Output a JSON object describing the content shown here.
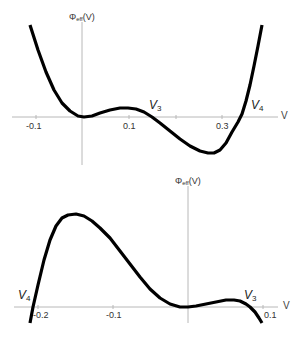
{
  "chart_data": [
    {
      "type": "line",
      "title": "",
      "xlabel": "V",
      "ylabel": "Φeff(V)",
      "ylabel_main": "Φ",
      "ylabel_sub": "eff",
      "ylabel_tail": "(V)",
      "x_ticks": [
        "-0.1",
        "0.1",
        "0.3"
      ],
      "x_tick_values": [
        -0.1,
        0.1,
        0.3
      ],
      "minor_ticks": [
        0.2
      ],
      "xlim": [
        -0.15,
        0.43
      ],
      "grid": false,
      "annotations": [
        {
          "text": "V",
          "sub": "3",
          "x": 0.155
        },
        {
          "text": "V",
          "sub": "4",
          "x": 0.34
        }
      ],
      "series": [
        {
          "name": "Φeff(V)",
          "points_px": [
            [
              30,
              25
            ],
            [
              38,
              50
            ],
            [
              46,
              72
            ],
            [
              54,
              90
            ],
            [
              62,
              103
            ],
            [
              70,
              111
            ],
            [
              78,
              116
            ],
            [
              84,
              117
            ],
            [
              92,
              116
            ],
            [
              100,
              113
            ],
            [
              110,
              110
            ],
            [
              120,
              108
            ],
            [
              128,
              108
            ],
            [
              136,
              109
            ],
            [
              144,
              112
            ],
            [
              152,
              117
            ],
            [
              160,
              123
            ],
            [
              170,
              131
            ],
            [
              180,
              139
            ],
            [
              190,
              146
            ],
            [
              200,
              151
            ],
            [
              208,
              153
            ],
            [
              214,
              153
            ],
            [
              220,
              150
            ],
            [
              226,
              143
            ],
            [
              232,
              132
            ],
            [
              238,
              122
            ],
            [
              242,
              114
            ],
            [
              246,
              101
            ],
            [
              250,
              85
            ],
            [
              254,
              66
            ],
            [
              258,
              46
            ],
            [
              262,
              25
            ]
          ]
        }
      ]
    },
    {
      "type": "line",
      "title": "",
      "xlabel": "V",
      "ylabel": "Φeff(V)",
      "ylabel_main": "Φ",
      "ylabel_sub": "eff",
      "ylabel_tail": "(V)",
      "x_ticks": [
        "-0.2",
        "-0.1",
        "0.1"
      ],
      "x_tick_values": [
        -0.2,
        -0.1,
        0.1
      ],
      "xlim": [
        -0.21,
        0.12
      ],
      "grid": false,
      "annotations": [
        {
          "text": "V",
          "sub": "4",
          "x": -0.207
        },
        {
          "text": "V",
          "sub": "3",
          "x": 0.083
        }
      ],
      "series": [
        {
          "name": "Φeff(V)",
          "points_px": [
            [
              30,
              323
            ],
            [
              33,
              307
            ],
            [
              38,
              285
            ],
            [
              44,
              260
            ],
            [
              50,
              240
            ],
            [
              56,
              226
            ],
            [
              62,
              218
            ],
            [
              68,
              215
            ],
            [
              76,
              214
            ],
            [
              84,
              216
            ],
            [
              92,
              221
            ],
            [
              100,
              228
            ],
            [
              110,
              238
            ],
            [
              120,
              251
            ],
            [
              130,
              264
            ],
            [
              140,
              277
            ],
            [
              150,
              289
            ],
            [
              160,
              298
            ],
            [
              170,
              304
            ],
            [
              180,
              307
            ],
            [
              188,
              307
            ],
            [
              196,
              306
            ],
            [
              206,
              304
            ],
            [
              216,
              302
            ],
            [
              226,
              300
            ],
            [
              234,
              300
            ],
            [
              240,
              301
            ],
            [
              246,
              304
            ],
            [
              250,
              307
            ],
            [
              255,
              312
            ],
            [
              259,
              318
            ],
            [
              262,
              323
            ]
          ]
        }
      ]
    }
  ],
  "plots": {
    "top": {
      "ylabel_main": "Φ",
      "ylabel_sub": "eff",
      "ylabel_tail": "(V)",
      "xlabel": "V",
      "ticks": [
        "-0.1",
        "0.1",
        "0.3"
      ],
      "v3_main": "V",
      "v3_sub": "3",
      "v4_main": "V",
      "v4_sub": "4"
    },
    "bottom": {
      "ylabel_main": "Φ",
      "ylabel_sub": "eff",
      "ylabel_tail": "(V)",
      "xlabel": "V",
      "ticks": [
        "-0.2",
        "-0.1",
        "0.1"
      ],
      "v3_main": "V",
      "v3_sub": "3",
      "v4_main": "V",
      "v4_sub": "4"
    }
  },
  "colors": {
    "curve": "#000000",
    "axis": "#b8b8b8",
    "text": "#333333"
  }
}
